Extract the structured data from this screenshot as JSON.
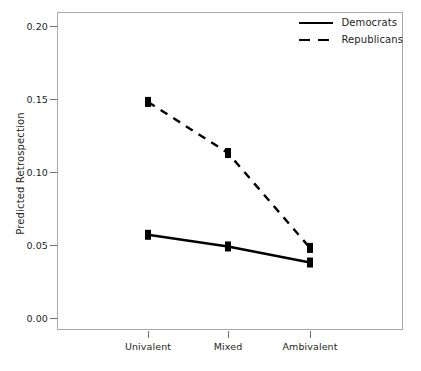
{
  "chart_data": {
    "type": "line",
    "title": "",
    "xlabel": "",
    "ylabel": "Predicted Retrospection",
    "categories": [
      "Univalent",
      "Mixed",
      "Ambivalent"
    ],
    "series": [
      {
        "name": "Democrats",
        "style": "solid",
        "marker": "square",
        "color": "#000000",
        "values": [
          0.057,
          0.049,
          0.038
        ]
      },
      {
        "name": "Republicans",
        "style": "dashed",
        "marker": "square",
        "color": "#000000",
        "values": [
          0.148,
          0.113,
          0.048
        ]
      }
    ],
    "yticks": [
      "0.00",
      "0.05",
      "0.10",
      "0.15",
      "0.20"
    ],
    "ytick_values": [
      0.0,
      0.05,
      0.1,
      0.15,
      0.2
    ],
    "ylim": [
      0.0,
      0.208
    ],
    "grid": false,
    "legend_position": "top-right"
  },
  "axes": {
    "y_title": "Predicted Retrospection",
    "y_labels": [
      "0.20",
      "0.15",
      "0.10",
      "0.05",
      "0.00"
    ],
    "x_labels": [
      "Univalent",
      "Mixed",
      "Ambivalent"
    ]
  },
  "legend": {
    "items": [
      {
        "label": "Democrats",
        "style": "solid"
      },
      {
        "label": "Republicans",
        "style": "dashed"
      }
    ]
  },
  "colors": {
    "line": "#000000",
    "frame": "#a9a9a9",
    "tick": "#6e6e6e",
    "text": "#231f20",
    "background": "#ffffff"
  }
}
